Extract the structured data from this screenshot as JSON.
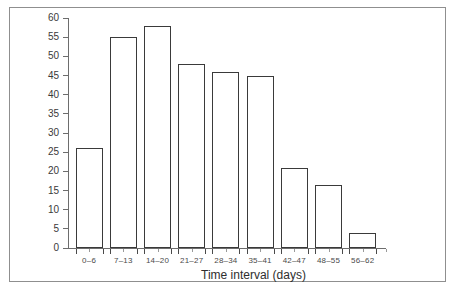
{
  "chart_data": {
    "type": "bar",
    "title": "",
    "subtitle": "",
    "xlabel": "Time interval (days)",
    "ylabel": "",
    "categories": [
      "0–6",
      "7–13",
      "14–20",
      "21–27",
      "28–34",
      "35–41",
      "42–47",
      "48–55",
      "56–62"
    ],
    "values": [
      26,
      55,
      58,
      48,
      46,
      45,
      21,
      16.5,
      4
    ],
    "ylim": [
      0,
      60
    ],
    "ytick_step": 5,
    "ytick_labels": [
      "0",
      "5",
      "10",
      "15",
      "20",
      "25",
      "30",
      "35",
      "40",
      "45",
      "50",
      "55",
      "60"
    ],
    "grid": false,
    "legend": null,
    "bar_fill_color": "#ffffff",
    "bar_edge_color": "#3a3a3a",
    "axis_color": "#6d6d6d",
    "frame_color": "#8f8f8f",
    "background_color": "#ffffff"
  }
}
